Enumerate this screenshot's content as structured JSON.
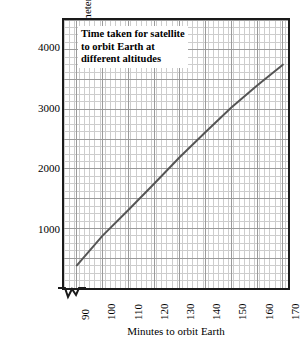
{
  "chart_data": {
    "type": "line",
    "title": "Time taken for satellite to orbit Earth at different altitudes",
    "title_lines": [
      "Time taken for satellite",
      "to orbit Earth at",
      "different altitudes"
    ],
    "xlabel": "Minutes to orbit Earth",
    "ylabel": "Altitude of satellite in kilometers",
    "xlim": [
      85,
      172
    ],
    "ylim": [
      0,
      4500
    ],
    "x_ticks": [
      90,
      100,
      110,
      120,
      130,
      140,
      150,
      160,
      170
    ],
    "x_tick_labels": [
      "90",
      "100",
      "110",
      "120",
      "130",
      "140",
      "150",
      "160",
      "170"
    ],
    "y_ticks": [
      1000,
      2000,
      3000,
      4000
    ],
    "y_tick_labels": [
      "1000",
      "2000",
      "3000",
      "4000"
    ],
    "grid": true,
    "grid_major_x_step": 10,
    "grid_major_y_step": 500,
    "grid_minor_x_step": 2,
    "grid_minor_y_step": 125,
    "legend": "none",
    "axis_break": "x-axis break between origin and 90",
    "series": [
      {
        "name": "Altitude vs orbital period",
        "x": [
          90,
          100,
          110,
          120,
          130,
          140,
          150,
          160,
          170
        ],
        "y": [
          380,
          880,
          1310,
          1750,
          2200,
          2620,
          3030,
          3400,
          3750
        ]
      }
    ]
  },
  "style": {
    "line_color": "#555555",
    "grid_major_color": "#999999",
    "grid_minor_color": "#cccccc",
    "frame_color": "#1a1a1a",
    "text_color": "#000000",
    "background": "#ffffff"
  }
}
